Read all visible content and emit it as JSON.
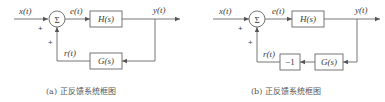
{
  "diagrams": [
    {
      "id": "a",
      "input_label": "x(t)",
      "sum_symbol": "Σ",
      "input_sign": "+",
      "feedback_sign": "+",
      "error_label": "e(t)",
      "forward_block": "H(s)",
      "output_label": "y(t)",
      "feedback_blocks": [
        "G(s)"
      ],
      "feedback_label": "r(t)",
      "caption": "(a) 正反馈系统框图"
    },
    {
      "id": "b",
      "input_label": "x(t)",
      "sum_symbol": "Σ",
      "input_sign": "+",
      "feedback_sign": "+",
      "error_label": "e(t)",
      "forward_block": "H(s)",
      "output_label": "y(t)",
      "feedback_blocks": [
        "G(s)",
        "−1"
      ],
      "feedback_label": "r(t)",
      "caption": "(b) 正反馈系统框图"
    }
  ],
  "colors": {
    "line": "#666666",
    "text": "#3a3a3a",
    "background": "#ffffff"
  }
}
